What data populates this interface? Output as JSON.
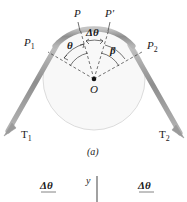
{
  "figure": {
    "caption": "(a)",
    "points": {
      "p": "P",
      "p_prime": "P′",
      "p1": "P",
      "p1_sub": "1",
      "p2": "P",
      "p2_sub": "2",
      "center": "O"
    },
    "angles": {
      "theta": "θ",
      "delta_theta": "Δθ",
      "beta": "β"
    },
    "tensions": {
      "t1": "T",
      "t1_sub": "1",
      "t2": "T",
      "t2_sub": "2"
    },
    "colors": {
      "rope": "#9a9a9a",
      "rope_light": "#c9c9c9",
      "circle_fill": "#f8f8f8",
      "circle_stroke": "#d8d8d8",
      "dash": "#3a3a3a",
      "text": "#1a1a1a",
      "background": "#ffffff"
    },
    "geometry": {
      "circle_center_x": 94,
      "circle_center_y": 79,
      "circle_radius": 51
    }
  },
  "bottom_strip": {
    "delta_theta_left": "Δθ",
    "axis_label_y": "y",
    "delta_theta_right": "Δθ"
  }
}
